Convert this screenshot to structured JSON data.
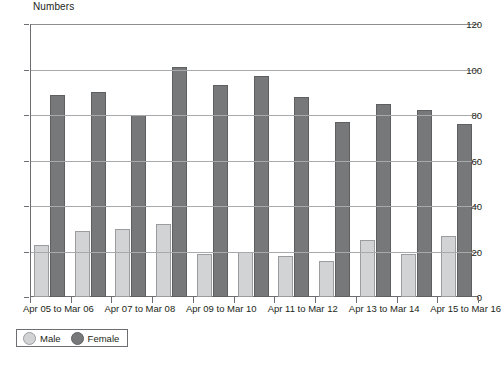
{
  "chart_data": {
    "type": "bar",
    "title": "",
    "ylabel": "Numbers",
    "xlabel": "",
    "ylim": [
      0,
      120
    ],
    "yticks": [
      0,
      20,
      40,
      60,
      80,
      100,
      120
    ],
    "grid": true,
    "legend_position": "bottom-left",
    "categories": [
      "Apr 05 to Mar 06",
      "Apr 06 to Mar 07",
      "Apr 07 to Mar 08",
      "Apr 08 to Mar 09",
      "Apr 09 to Mar 10",
      "Apr 10 to Mar 11",
      "Apr 11 to Mar 12",
      "Apr 12 to Mar 13",
      "Apr 13 to Mar 14",
      "Apr 14 to Mar 15",
      "Apr 15 to Mar 16"
    ],
    "visible_tick_labels": [
      "Apr 05 to Mar 06",
      "Apr 07 to Mar 08",
      "Apr 09 to Mar 10",
      "Apr 11 to Mar 12",
      "Apr 13 to Mar 14",
      "Apr 15 to Mar 16"
    ],
    "series": [
      {
        "name": "Male",
        "color": "#d2d3d5",
        "values": [
          23,
          29,
          30,
          32,
          19,
          20,
          18,
          16,
          25,
          19,
          27
        ]
      },
      {
        "name": "Female",
        "color": "#767879",
        "values": [
          89,
          90,
          80,
          101,
          93,
          97,
          88,
          77,
          85,
          82,
          76
        ]
      }
    ]
  },
  "legend": {
    "items": [
      {
        "label": "Male",
        "swatch": "male-circle-swatch"
      },
      {
        "label": "Female",
        "swatch": "female-circle-swatch"
      }
    ]
  }
}
